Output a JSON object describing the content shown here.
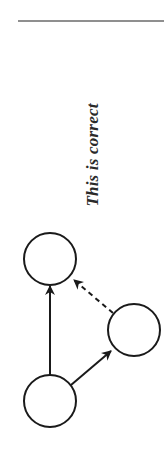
{
  "caption": "This is correct",
  "diagram": {
    "nodes": [
      {
        "id": "top",
        "cx": 50,
        "cy": 259,
        "r": 26
      },
      {
        "id": "right",
        "cx": 134,
        "cy": 330,
        "r": 26
      },
      {
        "id": "bottom",
        "cx": 50,
        "cy": 401,
        "r": 26
      }
    ],
    "edges": [
      {
        "from": "bottom",
        "to": "top",
        "style": "solid"
      },
      {
        "from": "bottom",
        "to": "right",
        "style": "solid"
      },
      {
        "from": "right",
        "to": "top",
        "style": "dashed"
      }
    ],
    "stroke_color": "#1a1a1a"
  }
}
